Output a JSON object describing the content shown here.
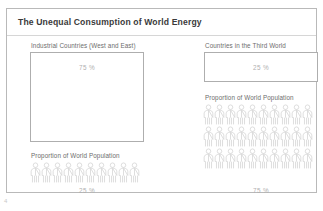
{
  "slide": {
    "title": "The Unequal Consumption of World Energy",
    "page_number": "4",
    "accent_color": "#b0b0b0",
    "frame_color": "#b9b9b9"
  },
  "left_panel": {
    "energy_label": "Industrial Countries (West and East)",
    "energy_percent": "75 %",
    "population_label": "Proportion of World Population",
    "population_percent": "25 %",
    "figure_rows": 1,
    "figures_per_row": 10
  },
  "right_panel": {
    "energy_label": "Countries in the Third World",
    "energy_percent": "25 %",
    "population_label": "Proportion of World Population",
    "population_percent": "75 %",
    "figure_rows": 3,
    "figures_per_row": 10
  },
  "chart_data": {
    "type": "pictogram",
    "title": "The Unequal Consumption of World Energy",
    "categories": [
      "Industrial Countries (West and East)",
      "Countries in the Third World"
    ],
    "series": [
      {
        "name": "Share of World Energy Consumption",
        "values": [
          75,
          25
        ],
        "unit": "%"
      },
      {
        "name": "Proportion of World Population",
        "values": [
          25,
          75
        ],
        "unit": "%"
      }
    ],
    "pictogram_unit_value": 2.5,
    "pictogram_counts": [
      10,
      30
    ],
    "xlabel": "",
    "ylabel": "",
    "legend": "none",
    "grid": false
  }
}
